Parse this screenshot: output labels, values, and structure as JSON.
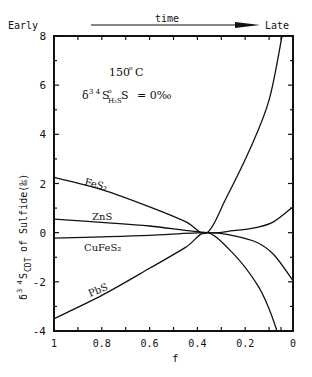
{
  "chart_data": {
    "type": "line",
    "title": "",
    "xlabel": "f",
    "ylabel": "δ34S CDT of Sulfide (‰)",
    "xlim": [
      1,
      0
    ],
    "ylim": [
      -4,
      8
    ],
    "x_ticks": [
      "1",
      "0.8",
      "0.6",
      "0.4",
      "0.2",
      "0"
    ],
    "y_ticks": [
      "8",
      "6",
      "4",
      "2",
      "0",
      "-2",
      "-4"
    ],
    "grid": false,
    "legend": "none (inline curve labels)",
    "annotations": {
      "top_left": "Early",
      "top_center": "time",
      "top_right": "Late",
      "temperature": "150° C",
      "condition": "δ34S H2S = 0‰"
    },
    "series": [
      {
        "name": "FeS2",
        "x": [
          1.0,
          0.8,
          0.6,
          0.45,
          0.36,
          0.28,
          0.18,
          0.1,
          0.046
        ],
        "y": [
          2.25,
          1.75,
          1.05,
          0.45,
          0.0,
          1.4,
          3.4,
          5.4,
          8.0
        ]
      },
      {
        "name": "ZnS",
        "x": [
          1.0,
          0.8,
          0.6,
          0.36,
          0.25,
          0.15,
          0.08,
          0.0
        ],
        "y": [
          0.55,
          0.42,
          0.27,
          0.0,
          0.08,
          0.22,
          0.45,
          1.05
        ]
      },
      {
        "name": "CuFeS2",
        "x": [
          1.0,
          0.8,
          0.6,
          0.36,
          0.25,
          0.15,
          0.08,
          0.0
        ],
        "y": [
          -0.22,
          -0.17,
          -0.11,
          0.0,
          -0.12,
          -0.4,
          -0.9,
          -1.95
        ]
      },
      {
        "name": "PbS",
        "x": [
          1.0,
          0.8,
          0.6,
          0.45,
          0.36,
          0.25,
          0.15,
          0.1,
          0.067
        ],
        "y": [
          -3.5,
          -2.55,
          -1.45,
          -0.6,
          0.0,
          -0.85,
          -2.1,
          -3.1,
          -4.0
        ]
      }
    ]
  },
  "labels": {
    "early": "Early",
    "time": "time",
    "late": "Late",
    "temp_value": "150",
    "temp_deg": "o",
    "temp_unit": "C",
    "delta": "δ",
    "iso": "3 4",
    "s": "S",
    "sub_h2s": "H₂S",
    "sup_mark": "o",
    "eq_value": "= 0‰",
    "ylab_delta": "δ",
    "ylab_iso": "3 4",
    "ylab_s": "S",
    "ylab_sub": "CDT",
    "ylab_rest": "of Sulfide(‰)",
    "xlab": "f",
    "curve_fes2": "FeS₂",
    "curve_zns": "ZnS",
    "curve_cufes2": "CuFeS₂",
    "curve_pbs": "PbS"
  }
}
